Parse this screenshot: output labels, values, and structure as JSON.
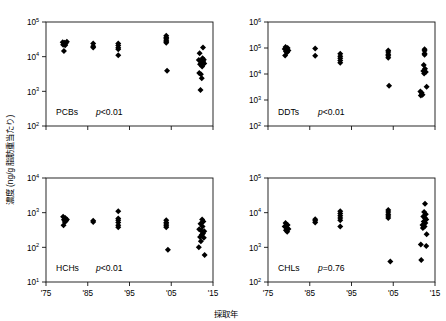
{
  "figure": {
    "axis_titles": {
      "x": "採取年",
      "y": "濃度 (ng/g 脂肪重当たり)"
    },
    "x_ticks": [
      "'75",
      "'85",
      "'95",
      "'05",
      "'15"
    ],
    "x_tick_values": [
      1975,
      1985,
      1995,
      2005,
      2015
    ]
  },
  "chart_data": [
    {
      "type": "scatter",
      "title": "PCBs",
      "annotation": "p<0.01",
      "p_italic": "p",
      "p_rest": "<0.01",
      "xlabel": "採取年",
      "ylabel": "濃度 (ng/g 脂肪重当たり)",
      "xlim": [
        1975,
        2015
      ],
      "ylim": [
        100,
        100000
      ],
      "yscale": "log",
      "y_ticks": [
        100,
        1000,
        10000,
        100000
      ],
      "y_tick_labels": [
        "10",
        "10",
        "10",
        "10"
      ],
      "y_tick_exponents": [
        "2",
        "3",
        "4",
        "5"
      ],
      "grid": false,
      "legend": "none",
      "points": [
        {
          "x": 1979.0,
          "y": 26000
        },
        {
          "x": 1979.4,
          "y": 25000
        },
        {
          "x": 1979.7,
          "y": 24000
        },
        {
          "x": 1979.1,
          "y": 22000
        },
        {
          "x": 1979.6,
          "y": 21500
        },
        {
          "x": 1980.0,
          "y": 27000
        },
        {
          "x": 1979.3,
          "y": 14500
        },
        {
          "x": 1986.3,
          "y": 24000
        },
        {
          "x": 1986.3,
          "y": 20000
        },
        {
          "x": 1986.3,
          "y": 18500
        },
        {
          "x": 1992.3,
          "y": 24000
        },
        {
          "x": 1992.3,
          "y": 21000
        },
        {
          "x": 1992.3,
          "y": 18000
        },
        {
          "x": 1992.3,
          "y": 16500
        },
        {
          "x": 1992.3,
          "y": 11000
        },
        {
          "x": 2003.8,
          "y": 40000
        },
        {
          "x": 2003.8,
          "y": 36000
        },
        {
          "x": 2003.8,
          "y": 33000
        },
        {
          "x": 2003.8,
          "y": 30000
        },
        {
          "x": 2003.8,
          "y": 27000
        },
        {
          "x": 2003.8,
          "y": 25000
        },
        {
          "x": 2004.0,
          "y": 3900
        },
        {
          "x": 2012.6,
          "y": 18500
        },
        {
          "x": 2011.8,
          "y": 12500
        },
        {
          "x": 2011.6,
          "y": 8000
        },
        {
          "x": 2012.5,
          "y": 9000
        },
        {
          "x": 2012.8,
          "y": 8200
        },
        {
          "x": 2012.6,
          "y": 7200
        },
        {
          "x": 2012.2,
          "y": 6600
        },
        {
          "x": 2012.9,
          "y": 6300
        },
        {
          "x": 2011.9,
          "y": 6000
        },
        {
          "x": 2012.4,
          "y": 5200
        },
        {
          "x": 2011.7,
          "y": 3400
        },
        {
          "x": 2012.1,
          "y": 3100
        },
        {
          "x": 2012.3,
          "y": 2400
        },
        {
          "x": 2012.0,
          "y": 1100
        }
      ]
    },
    {
      "type": "scatter",
      "title": "DDTs",
      "annotation": "p<0.01",
      "p_italic": "p",
      "p_rest": "<0.01",
      "xlabel": "採取年",
      "ylabel": "濃度 (ng/g 脂肪重当たり)",
      "xlim": [
        1975,
        2015
      ],
      "ylim": [
        100,
        1000000
      ],
      "yscale": "log",
      "y_ticks": [
        100,
        1000,
        10000,
        100000,
        1000000
      ],
      "y_tick_labels": [
        "10",
        "10",
        "10",
        "10",
        "10"
      ],
      "y_tick_exponents": [
        "2",
        "3",
        "4",
        "5",
        "6"
      ],
      "grid": false,
      "legend": "none",
      "points": [
        {
          "x": 1979.2,
          "y": 110000
        },
        {
          "x": 1979.7,
          "y": 100000
        },
        {
          "x": 1979.0,
          "y": 92000
        },
        {
          "x": 1979.5,
          "y": 88000
        },
        {
          "x": 1979.9,
          "y": 80000
        },
        {
          "x": 1979.3,
          "y": 74000
        },
        {
          "x": 1979.6,
          "y": 68000
        },
        {
          "x": 1979.1,
          "y": 52000
        },
        {
          "x": 1986.3,
          "y": 95000
        },
        {
          "x": 1986.3,
          "y": 50000
        },
        {
          "x": 1992.3,
          "y": 60000
        },
        {
          "x": 1992.3,
          "y": 48000
        },
        {
          "x": 1992.3,
          "y": 40000
        },
        {
          "x": 1992.3,
          "y": 33000
        },
        {
          "x": 1992.3,
          "y": 27000
        },
        {
          "x": 2003.8,
          "y": 80000
        },
        {
          "x": 2003.8,
          "y": 70000
        },
        {
          "x": 2003.8,
          "y": 58000
        },
        {
          "x": 2003.8,
          "y": 50000
        },
        {
          "x": 2003.8,
          "y": 42000
        },
        {
          "x": 2004.0,
          "y": 3500
        },
        {
          "x": 2012.5,
          "y": 90000
        },
        {
          "x": 2012.5,
          "y": 78000
        },
        {
          "x": 2012.5,
          "y": 62000
        },
        {
          "x": 2012.5,
          "y": 55000
        },
        {
          "x": 2012.3,
          "y": 22000
        },
        {
          "x": 2012.6,
          "y": 16000
        },
        {
          "x": 2012.2,
          "y": 13000
        },
        {
          "x": 2012.8,
          "y": 12000
        },
        {
          "x": 2012.4,
          "y": 10500
        },
        {
          "x": 2011.5,
          "y": 2100
        },
        {
          "x": 2011.8,
          "y": 1900
        },
        {
          "x": 2012.0,
          "y": 1600
        },
        {
          "x": 2011.6,
          "y": 1500
        },
        {
          "x": 2013.0,
          "y": 3200
        }
      ]
    },
    {
      "type": "scatter",
      "title": "HCHs",
      "annotation": "p<0.01",
      "p_italic": "p",
      "p_rest": "<0.01",
      "xlabel": "採取年",
      "ylabel": "濃度 (ng/g 脂肪重当たり)",
      "xlim": [
        1975,
        2015
      ],
      "ylim": [
        10,
        10000
      ],
      "yscale": "log",
      "y_ticks": [
        10,
        100,
        1000,
        10000
      ],
      "y_tick_labels": [
        "10",
        "10",
        "10",
        "10"
      ],
      "y_tick_exponents": [
        "1",
        "2",
        "3",
        "4"
      ],
      "grid": false,
      "legend": "none",
      "points": [
        {
          "x": 1979.1,
          "y": 760
        },
        {
          "x": 1979.6,
          "y": 700
        },
        {
          "x": 1980.0,
          "y": 640
        },
        {
          "x": 1979.3,
          "y": 620
        },
        {
          "x": 1979.8,
          "y": 580
        },
        {
          "x": 1979.5,
          "y": 540
        },
        {
          "x": 1979.2,
          "y": 430
        },
        {
          "x": 1986.3,
          "y": 580
        },
        {
          "x": 1986.3,
          "y": 540
        },
        {
          "x": 1992.3,
          "y": 1100
        },
        {
          "x": 1992.3,
          "y": 680
        },
        {
          "x": 1992.3,
          "y": 600
        },
        {
          "x": 1992.3,
          "y": 520
        },
        {
          "x": 1992.3,
          "y": 430
        },
        {
          "x": 1992.3,
          "y": 380
        },
        {
          "x": 2003.8,
          "y": 600
        },
        {
          "x": 2003.8,
          "y": 520
        },
        {
          "x": 2003.8,
          "y": 470
        },
        {
          "x": 2003.8,
          "y": 420
        },
        {
          "x": 2003.8,
          "y": 380
        },
        {
          "x": 2004.2,
          "y": 85
        },
        {
          "x": 2012.4,
          "y": 640
        },
        {
          "x": 2012.7,
          "y": 560
        },
        {
          "x": 2012.0,
          "y": 480
        },
        {
          "x": 2012.5,
          "y": 400
        },
        {
          "x": 2011.7,
          "y": 330
        },
        {
          "x": 2012.2,
          "y": 300
        },
        {
          "x": 2012.9,
          "y": 290
        },
        {
          "x": 2012.6,
          "y": 250
        },
        {
          "x": 2012.3,
          "y": 230
        },
        {
          "x": 2011.9,
          "y": 200
        },
        {
          "x": 2012.8,
          "y": 190
        },
        {
          "x": 2012.1,
          "y": 150
        },
        {
          "x": 2011.6,
          "y": 100
        },
        {
          "x": 2013.0,
          "y": 60
        }
      ]
    },
    {
      "type": "scatter",
      "title": "CHLs",
      "annotation": "p=0.76",
      "p_italic": "p",
      "p_rest": "=0.76",
      "xlabel": "採取年",
      "ylabel": "濃度 (ng/g 脂肪重当たり)",
      "xlim": [
        1975,
        2015
      ],
      "ylim": [
        100,
        100000
      ],
      "yscale": "log",
      "y_ticks": [
        100,
        1000,
        10000,
        100000
      ],
      "y_tick_labels": [
        "10",
        "10",
        "10",
        "10"
      ],
      "y_tick_exponents": [
        "2",
        "3",
        "4",
        "5"
      ],
      "grid": false,
      "legend": "none",
      "points": [
        {
          "x": 1979.2,
          "y": 5000
        },
        {
          "x": 1979.7,
          "y": 4400
        },
        {
          "x": 1979.0,
          "y": 4000
        },
        {
          "x": 1979.5,
          "y": 3700
        },
        {
          "x": 1979.9,
          "y": 3400
        },
        {
          "x": 1979.3,
          "y": 3100
        },
        {
          "x": 1979.6,
          "y": 2800
        },
        {
          "x": 1986.3,
          "y": 6500
        },
        {
          "x": 1986.3,
          "y": 5800
        },
        {
          "x": 1986.3,
          "y": 5200
        },
        {
          "x": 1992.3,
          "y": 11000
        },
        {
          "x": 1992.3,
          "y": 9500
        },
        {
          "x": 1992.3,
          "y": 8200
        },
        {
          "x": 1992.3,
          "y": 7000
        },
        {
          "x": 1992.3,
          "y": 6000
        },
        {
          "x": 1992.3,
          "y": 4000
        },
        {
          "x": 2003.8,
          "y": 12000
        },
        {
          "x": 2003.8,
          "y": 10500
        },
        {
          "x": 2003.8,
          "y": 9000
        },
        {
          "x": 2003.8,
          "y": 8000
        },
        {
          "x": 2003.8,
          "y": 7000
        },
        {
          "x": 2004.3,
          "y": 390
        },
        {
          "x": 2012.6,
          "y": 18000
        },
        {
          "x": 2012.4,
          "y": 10500
        },
        {
          "x": 2012.8,
          "y": 9000
        },
        {
          "x": 2012.2,
          "y": 7800
        },
        {
          "x": 2012.6,
          "y": 7000
        },
        {
          "x": 2012.9,
          "y": 6400
        },
        {
          "x": 2012.3,
          "y": 5600
        },
        {
          "x": 2012.7,
          "y": 5000
        },
        {
          "x": 2012.0,
          "y": 4400
        },
        {
          "x": 2012.5,
          "y": 4000
        },
        {
          "x": 2012.1,
          "y": 3600
        },
        {
          "x": 2013.0,
          "y": 2400
        },
        {
          "x": 2011.6,
          "y": 1200
        },
        {
          "x": 2012.9,
          "y": 1100
        },
        {
          "x": 2011.7,
          "y": 430
        }
      ]
    }
  ]
}
